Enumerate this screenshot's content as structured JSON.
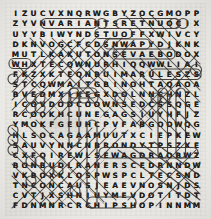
{
  "puzzle": {
    "type": "word-search",
    "rows": 20,
    "cols": 21,
    "ink_color": "#2a2724",
    "paper_color": "#eeede9",
    "letter_color": "#1d1b19",
    "grid": [
      "IZUCVXNQRWGBYZOCGMOPP",
      "ZYVNVARIANTSRETNUOCIX",
      "UYYBIWYNDSTUOFFXWIVCY",
      "DKNVOGCFCDSNWAPYDJKNK",
      "MUTLKAKUTONSEVAEBODOX",
      "WHXTECQWNURHIQQWWLIAI",
      "FKZXKTEQNBUIMARULESZS",
      "STCQWMAITGBINOHTAQAOA",
      "BVEDMXIKEGXDOLNNCHNZL",
      "ICOVDODCOOWNSEDCSSQGE",
      "RCOOKHCUNEGAGSIUYHFJZ",
      "YMOKFGEUHCPVFABGOOWQG",
      "HLSOCAGAAMUUTXCIEPKEW",
      "SAUVYNNCNBRONDYTPSZXE",
      "CXFQIREWLSEWAGDRAOBWZ",
      "BONBUDLRANERSCEDRNNDW",
      "VKBOXKLOSPWSPCLTECSND",
      "TNCONCAUSJEAEVNOSNJDS",
      "CVTJXSHNIUYMEVDOTITDT",
      "FDNMNRCRCHIPSHOPINNMM"
    ],
    "found_words": [
      {
        "word": "VARIANTS",
        "row": 2,
        "start_col": 5,
        "end_col": 12,
        "direction": "horizontal"
      },
      {
        "word": "COUNTER",
        "row": 2,
        "start_col": 13,
        "end_col": 20,
        "direction": "horizontal-reversed"
      },
      {
        "word": "RULES",
        "row": 7,
        "start_col": 16,
        "end_col": 20,
        "direction": "horizontal"
      },
      {
        "word": "BEAVES",
        "row": 5,
        "start_col": 12,
        "end_col": 18,
        "direction": "horizontal-reversed"
      },
      {
        "word": "BOARD",
        "row": 15,
        "start_col": 15,
        "end_col": 20,
        "direction": "horizontal-reversed"
      },
      {
        "word": "SEWAGE",
        "row": 15,
        "start_col": 10,
        "end_col": 15,
        "direction": "horizontal"
      },
      {
        "word": "CHIPS",
        "row": 20,
        "start_col": 9,
        "end_col": 13,
        "direction": "horizontal"
      },
      {
        "word": "SNWAP",
        "row": 4,
        "start_col": 11,
        "end_col": 15,
        "direction": "horizontal"
      },
      {
        "word": "STUO",
        "row": 3,
        "start_col": 10,
        "end_col": 13,
        "direction": "horizontal"
      },
      {
        "word": "KEG",
        "row": 9,
        "start_col": 7,
        "end_col": 9,
        "direction": "horizontal"
      },
      {
        "word": "DOWN",
        "row": 6,
        "start_col": 7,
        "end_col": 12,
        "direction": "horizontal"
      }
    ]
  }
}
